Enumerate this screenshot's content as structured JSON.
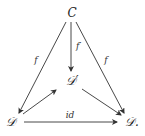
{
  "diagram": {
    "type": "commutative-diagram",
    "nodes": [
      {
        "id": "C",
        "label": "C",
        "x": 72,
        "y": 17
      },
      {
        "id": "Dp",
        "label": "𝒟′",
        "x": 72,
        "y": 84
      },
      {
        "id": "D",
        "label": "𝒟",
        "x": 11,
        "y": 125
      },
      {
        "id": "Ddot",
        "label": "𝒟.",
        "x": 131,
        "y": 125
      }
    ],
    "edges": [
      {
        "from": "C",
        "to": "D",
        "label": "f"
      },
      {
        "from": "C",
        "to": "Dp",
        "label": "f′"
      },
      {
        "from": "C",
        "to": "Ddot",
        "label": "f"
      },
      {
        "from": "D",
        "to": "Dp",
        "label": ""
      },
      {
        "from": "Dp",
        "to": "Ddot",
        "label": ""
      },
      {
        "from": "D",
        "to": "Ddot",
        "label": "id"
      }
    ],
    "colors": {
      "arrow": "#333333",
      "text": "#222222"
    }
  }
}
